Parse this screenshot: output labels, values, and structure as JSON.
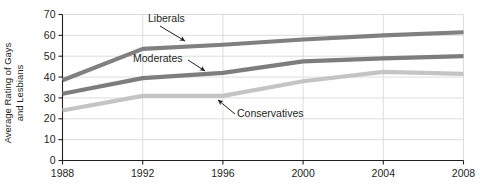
{
  "chart_data": {
    "type": "line",
    "title": "",
    "subtitle": "",
    "xlabel": "",
    "ylabel": "Average Rating of Gays and Lesbians",
    "ylabel_line1": "Average Rating of Gays",
    "ylabel_line2": "and Lesbians",
    "categories": [
      "1988",
      "1992",
      "1996",
      "2000",
      "2004",
      "2008"
    ],
    "x": [
      1988,
      1992,
      1996,
      2000,
      2004,
      2008
    ],
    "xlim": [
      1988,
      2008
    ],
    "ylim": [
      0,
      70
    ],
    "yticks": [
      0,
      10,
      20,
      30,
      40,
      50,
      60,
      70
    ],
    "ytick_labels": [
      "0",
      "10",
      "20",
      "30",
      "40",
      "50",
      "60",
      "70"
    ],
    "xticks": [
      1988,
      1992,
      1996,
      2000,
      2004,
      2008
    ],
    "xtick_labels": [
      "1988",
      "1992",
      "1996",
      "2000",
      "2004",
      "2008"
    ],
    "grid": true,
    "grid_axis": "both",
    "legend": "none",
    "legend_position": "inline-annotations",
    "series": [
      {
        "name": "Liberals",
        "color": "#808080",
        "values": [
          38.5,
          53.5,
          55.5,
          58.0,
          60.0,
          61.5
        ]
      },
      {
        "name": "Moderates",
        "color": "#7d7d7d",
        "values": [
          32.0,
          39.5,
          42.0,
          47.5,
          49.0,
          50.0
        ]
      },
      {
        "name": "Conservatives",
        "color": "#c4c4c4",
        "values": [
          24.0,
          31.0,
          31.0,
          38.0,
          42.5,
          41.5
        ]
      }
    ],
    "annotations": [
      {
        "text": "Liberals",
        "series": "Liberals",
        "label_x": 148,
        "label_y": 22,
        "arrow_from_x": 160,
        "arrow_from_y": 26,
        "arrow_to_x": 185,
        "arrow_to_y": 41
      },
      {
        "text": "Moderates",
        "series": "Moderates",
        "label_x": 133,
        "label_y": 62,
        "arrow_from_x": 188,
        "arrow_from_y": 60,
        "arrow_to_x": 205,
        "arrow_to_y": 71
      },
      {
        "text": "Conservatives",
        "series": "Conservatives",
        "label_x": 237,
        "label_y": 117,
        "arrow_from_x": 235,
        "arrow_from_y": 114,
        "arrow_to_x": 218,
        "arrow_to_y": 100
      }
    ],
    "colors": {
      "axis": "#231f20",
      "grid": "#d9d9d9",
      "background": "#ffffff",
      "liberals": "#808080",
      "moderates": "#7d7d7d",
      "conservatives": "#c4c4c4"
    }
  }
}
